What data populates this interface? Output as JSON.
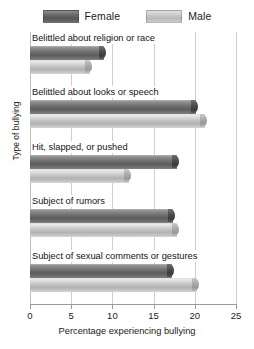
{
  "chart_data": {
    "type": "bar",
    "orientation": "horizontal",
    "title": "",
    "subtitle": "",
    "xlabel": "Percentage experiencing bullying",
    "ylabel": "Type of bullying",
    "xlim": [
      0,
      25
    ],
    "xticks": [
      0,
      5,
      10,
      15,
      20,
      25
    ],
    "xtick_labels": [
      "0",
      "5",
      "10",
      "15",
      "20",
      "25"
    ],
    "grid": true,
    "grid_axis": "x",
    "legend_position": "top-center",
    "categories": [
      "Belittled about religion or race",
      "Belittled about looks or speech",
      "Hit, slapped, or pushed",
      "Subject of rumors",
      "Subject of sexual comments or gestures"
    ],
    "series": [
      {
        "name": "Female",
        "color": "#5c5c5c",
        "values": [
          9.0,
          20.2,
          17.8,
          17.3,
          17.2
        ]
      },
      {
        "name": "Male",
        "color": "#b8b8b8",
        "values": [
          7.3,
          21.2,
          12.0,
          17.8,
          20.3
        ]
      }
    ],
    "annotations": []
  },
  "legend": {
    "entries": [
      {
        "label": "Female",
        "swatch": "female-swatch"
      },
      {
        "label": "Male",
        "swatch": "male-swatch"
      }
    ]
  },
  "axes": {
    "x_title": "Percentage experiencing bullying",
    "y_title": "Type of bullying",
    "x_tick_labels": [
      "0",
      "5",
      "10",
      "15",
      "20",
      "25"
    ]
  },
  "colors": {
    "female": "#5c5c5c",
    "male": "#b8b8b8",
    "gridline": "#cfcfcf",
    "axis": "#9a9a9a",
    "text": "#1a1a1a",
    "background": "#ffffff"
  }
}
